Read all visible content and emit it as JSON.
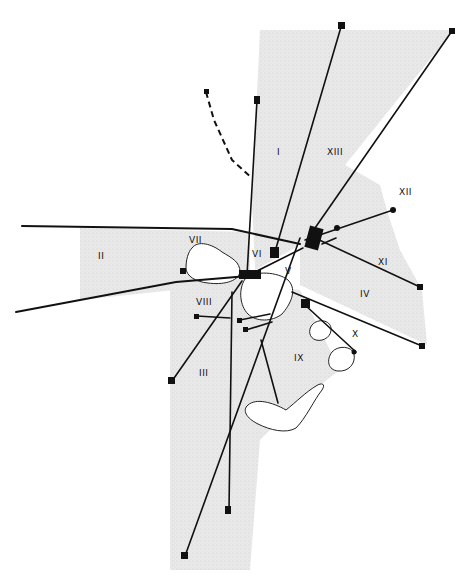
{
  "figure": {
    "type": "sector map with radiating transect lines",
    "colors": {
      "shading": "#e6e6e6",
      "line": "#111111",
      "background": "#ffffff"
    },
    "sectors": [
      {
        "id": "I",
        "label": "I",
        "x": 277,
        "y": 152
      },
      {
        "id": "II",
        "label": "II",
        "x": 100,
        "y": 256
      },
      {
        "id": "III",
        "label": "III",
        "x": 203,
        "y": 373
      },
      {
        "id": "IV",
        "label": "IV",
        "x": 364,
        "y": 294
      },
      {
        "id": "V",
        "label": "V",
        "x": 287,
        "y": 271
      },
      {
        "id": "VI",
        "label": "VI",
        "x": 257,
        "y": 254
      },
      {
        "id": "VII",
        "label": "VII",
        "x": 195,
        "y": 240
      },
      {
        "id": "VIII",
        "label": "VIII",
        "x": 203,
        "y": 302
      },
      {
        "id": "IX",
        "label": "IX",
        "x": 298,
        "y": 358
      },
      {
        "id": "X",
        "label": "X",
        "x": 354,
        "y": 334
      },
      {
        "id": "XI",
        "label": "XI",
        "x": 382,
        "y": 262
      },
      {
        "id": "XII",
        "label": "XII",
        "x": 404,
        "y": 192
      },
      {
        "id": "XIII",
        "label": "XIII",
        "x": 333,
        "y": 152
      }
    ],
    "legend_items": [
      {
        "symbol": "square-node-icon",
        "meaning": "transect endpoint"
      },
      {
        "symbol": "dashed-line",
        "meaning": "dashed transect"
      },
      {
        "symbol": "shaded-area",
        "meaning": "sector area"
      }
    ]
  }
}
